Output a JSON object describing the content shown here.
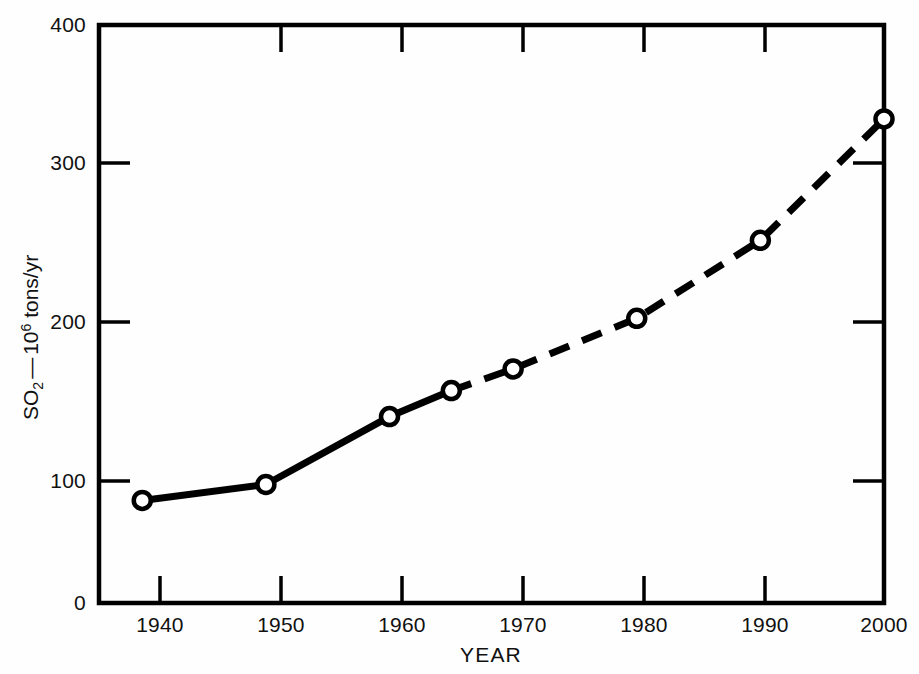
{
  "chart_data": {
    "type": "line",
    "title": "",
    "subtitle": "",
    "xlabel": "YEAR",
    "ylabel": "SO2 - 10^6 tons/yr",
    "ylabel_parts": {
      "species": "SO",
      "species_sub": "2",
      "dash": "—",
      "mantissa": "10",
      "exponent": "6",
      "units": " tons/yr"
    },
    "x": [
      1940,
      1950,
      1960,
      1965,
      1970,
      1980,
      1990,
      2000
    ],
    "values": [
      71,
      82,
      129,
      147,
      162,
      197,
      251,
      335
    ],
    "series": [
      {
        "name": "Global SO2 emissions",
        "x": [
          1940,
          1950,
          1960,
          1965,
          1970,
          1980,
          1990,
          2000
        ],
        "values": [
          71,
          82,
          129,
          147,
          162,
          197,
          251,
          335
        ]
      }
    ],
    "segment_styles": [
      {
        "from": 1940,
        "to": 1950,
        "style": "solid"
      },
      {
        "from": 1950,
        "to": 1960,
        "style": "solid"
      },
      {
        "from": 1960,
        "to": 1965,
        "style": "solid"
      },
      {
        "from": 1965,
        "to": 1970,
        "style": "dashed"
      },
      {
        "from": 1970,
        "to": 1980,
        "style": "dashed"
      },
      {
        "from": 1980,
        "to": 1990,
        "style": "dashed"
      },
      {
        "from": 1990,
        "to": 2000,
        "style": "dashed"
      }
    ],
    "marker": "open-circle",
    "xlim": [
      1936.5,
      2000
    ],
    "ylim": [
      0,
      400
    ],
    "xticks": [
      1940,
      1950,
      1960,
      1970,
      1980,
      1990,
      2000
    ],
    "xtick_labels": [
      "1940",
      "1950",
      "1960",
      "1970",
      "1980",
      "1990",
      "2000"
    ],
    "yticks": [
      0,
      100,
      200,
      300,
      400
    ],
    "ytick_labels": [
      "0",
      "100",
      "200",
      "300",
      "400"
    ],
    "grid": false,
    "legend": null,
    "colors": {
      "line": "#000000",
      "marker_fill": "#ffffff",
      "marker_stroke": "#000000",
      "axis": "#000000",
      "background": "#ffffff"
    }
  }
}
